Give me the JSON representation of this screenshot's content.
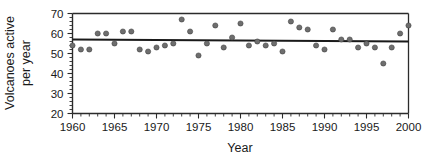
{
  "chart_data": {
    "type": "scatter",
    "title": "",
    "xlabel": "Year",
    "ylabel": "Volcanoes active per year",
    "ylabel_line1": "Volcanoes active",
    "ylabel_line2": "per year",
    "xlim": [
      1960,
      2000
    ],
    "ylim": [
      20,
      70
    ],
    "xticks": [
      1960,
      1965,
      1970,
      1975,
      1980,
      1985,
      1990,
      1995,
      2000
    ],
    "xtick_labels": [
      "1960",
      "1965",
      "1970",
      "1975",
      "1980",
      "1985",
      "1990",
      "1995",
      "2000"
    ],
    "yticks": [
      20,
      30,
      40,
      50,
      60,
      70
    ],
    "ytick_labels": [
      "20",
      "30",
      "40",
      "50",
      "60",
      "70"
    ],
    "x_minor_step": 1,
    "y_minor_step": 2,
    "grid": false,
    "legend": null,
    "marker_color": "#6e6e6e",
    "marker_edge_color": "#3d3d3d",
    "marker_size": 5.2,
    "axis_color": "#2b2b2b",
    "trendline": {
      "label": "",
      "color": "#1a1a1a",
      "x_start": 1960,
      "x_end": 2000,
      "y_start": 57.0,
      "y_end": 56.0
    },
    "x": [
      1960,
      1961,
      1962,
      1963,
      1964,
      1965,
      1966,
      1967,
      1968,
      1969,
      1970,
      1971,
      1972,
      1973,
      1974,
      1975,
      1976,
      1977,
      1978,
      1979,
      1980,
      1981,
      1982,
      1983,
      1984,
      1985,
      1986,
      1987,
      1988,
      1989,
      1990,
      1991,
      1992,
      1993,
      1994,
      1995,
      1996,
      1997,
      1998,
      1999,
      2000
    ],
    "values": [
      54,
      52,
      52,
      60,
      60,
      55,
      61,
      61,
      52,
      51,
      53,
      54,
      55,
      67,
      61,
      49,
      55,
      64,
      53,
      58,
      65,
      54,
      56,
      54,
      55,
      51,
      66,
      63,
      62,
      54,
      52,
      62,
      57,
      57,
      53,
      55,
      53,
      45,
      53,
      60,
      64
    ],
    "points": [
      {
        "year": 1960,
        "value": 54
      },
      {
        "year": 1961,
        "value": 52
      },
      {
        "year": 1962,
        "value": 52
      },
      {
        "year": 1963,
        "value": 60
      },
      {
        "year": 1964,
        "value": 60
      },
      {
        "year": 1965,
        "value": 55
      },
      {
        "year": 1966,
        "value": 61
      },
      {
        "year": 1967,
        "value": 61
      },
      {
        "year": 1968,
        "value": 52
      },
      {
        "year": 1969,
        "value": 51
      },
      {
        "year": 1970,
        "value": 53
      },
      {
        "year": 1971,
        "value": 54
      },
      {
        "year": 1972,
        "value": 55
      },
      {
        "year": 1973,
        "value": 67
      },
      {
        "year": 1974,
        "value": 61
      },
      {
        "year": 1975,
        "value": 49
      },
      {
        "year": 1976,
        "value": 55
      },
      {
        "year": 1977,
        "value": 64
      },
      {
        "year": 1978,
        "value": 53
      },
      {
        "year": 1979,
        "value": 58
      },
      {
        "year": 1980,
        "value": 65
      },
      {
        "year": 1981,
        "value": 54
      },
      {
        "year": 1982,
        "value": 56
      },
      {
        "year": 1983,
        "value": 54
      },
      {
        "year": 1984,
        "value": 55
      },
      {
        "year": 1985,
        "value": 51
      },
      {
        "year": 1986,
        "value": 66
      },
      {
        "year": 1987,
        "value": 63
      },
      {
        "year": 1988,
        "value": 62
      },
      {
        "year": 1989,
        "value": 54
      },
      {
        "year": 1990,
        "value": 52
      },
      {
        "year": 1991,
        "value": 62
      },
      {
        "year": 1992,
        "value": 57
      },
      {
        "year": 1993,
        "value": 57
      },
      {
        "year": 1994,
        "value": 53
      },
      {
        "year": 1995,
        "value": 55
      },
      {
        "year": 1996,
        "value": 53
      },
      {
        "year": 1997,
        "value": 45
      },
      {
        "year": 1998,
        "value": 53
      },
      {
        "year": 1999,
        "value": 60
      },
      {
        "year": 2000,
        "value": 64
      }
    ]
  }
}
